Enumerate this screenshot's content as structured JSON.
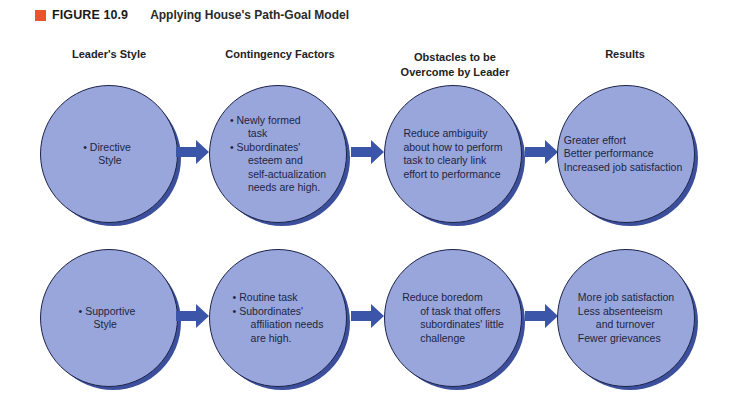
{
  "figure": {
    "label": "FIGURE 10.9",
    "title": "Applying House's Path-Goal Model",
    "accent_color": "#e8542e"
  },
  "columns": [
    {
      "header": "Leader's Style"
    },
    {
      "header": "Contingency Factors"
    },
    {
      "header_line1": "Obstacles to be",
      "header_line2": "Overcome by Leader"
    },
    {
      "header": "Results"
    }
  ],
  "rows": [
    {
      "leader_style": {
        "line1": "• Directive",
        "line2": "Style"
      },
      "contingency": {
        "line1": "• Newly formed",
        "line2": "task",
        "line3": "• Subordinates'",
        "line4": "esteem and",
        "line5": "self-actualization",
        "line6": "needs are high."
      },
      "obstacles": {
        "line1": "Reduce ambiguity",
        "line2": "about how to perform",
        "line3": "task to clearly link",
        "line4": "effort to performance"
      },
      "results": {
        "line1": "Greater effort",
        "line2": "Better performance",
        "line3": "Increased job satisfaction"
      }
    },
    {
      "leader_style": {
        "line1": "• Supportive",
        "line2": "Style"
      },
      "contingency": {
        "line1": "• Routine task",
        "line2": "• Subordinates'",
        "line3": "affiliation needs",
        "line4": "are high."
      },
      "obstacles": {
        "line1": "Reduce boredom",
        "line2": "of task that offers",
        "line3": "subordinates' little",
        "line4": "challenge"
      },
      "results": {
        "line1": "More job satisfaction",
        "line2": "Less absenteeism",
        "line3": "and turnover",
        "line4": "Fewer grievances"
      }
    }
  ],
  "colors": {
    "circle_fill": "#98a6dc",
    "circle_outline": "#1d2347",
    "circle_shadow": "#3c4f9c",
    "arrow": "#3b56a8"
  }
}
